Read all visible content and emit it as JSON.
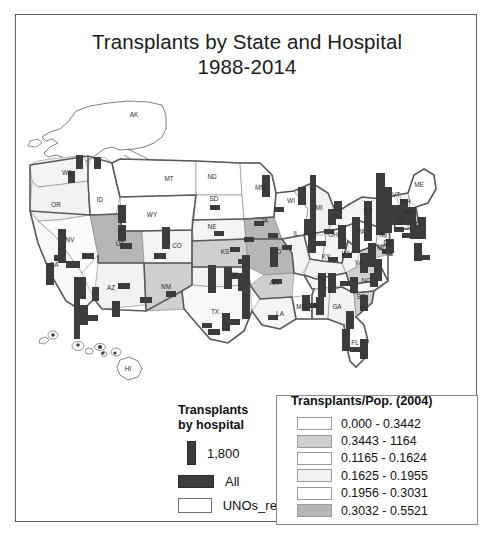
{
  "title": {
    "line1": "Transplants by State and Hospital",
    "line2": "1988-2014"
  },
  "map": {
    "state_labels": [
      {
        "code": "AK",
        "x": 118,
        "y": 38
      },
      {
        "code": "HI",
        "x": 112,
        "y": 293
      },
      {
        "code": "WA",
        "x": 51,
        "y": 98
      },
      {
        "code": "OR",
        "x": 40,
        "y": 130
      },
      {
        "code": "ID",
        "x": 84,
        "y": 125
      },
      {
        "code": "MT",
        "x": 153,
        "y": 104
      },
      {
        "code": "WY",
        "x": 136,
        "y": 140
      },
      {
        "code": "NV",
        "x": 54,
        "y": 165
      },
      {
        "code": "UT",
        "x": 104,
        "y": 169
      },
      {
        "code": "CA",
        "x": 38,
        "y": 190
      },
      {
        "code": "AZ",
        "x": 95,
        "y": 213
      },
      {
        "code": "NM",
        "x": 150,
        "y": 212
      },
      {
        "code": "CO",
        "x": 161,
        "y": 171
      },
      {
        "code": "ND",
        "x": 196,
        "y": 102
      },
      {
        "code": "SD",
        "x": 198,
        "y": 124
      },
      {
        "code": "NE",
        "x": 196,
        "y": 152
      },
      {
        "code": "KS",
        "x": 209,
        "y": 177
      },
      {
        "code": "OK",
        "x": 217,
        "y": 200
      },
      {
        "code": "TX",
        "x": 199,
        "y": 237
      },
      {
        "code": "MN",
        "x": 244,
        "y": 113
      },
      {
        "code": "IA",
        "x": 249,
        "y": 146
      },
      {
        "code": "MO",
        "x": 260,
        "y": 177
      },
      {
        "code": "AR",
        "x": 258,
        "y": 208
      },
      {
        "code": "LA",
        "x": 264,
        "y": 239
      },
      {
        "code": "WI",
        "x": 275,
        "y": 126
      },
      {
        "code": "IL",
        "x": 280,
        "y": 159
      },
      {
        "code": "MS",
        "x": 285,
        "y": 232
      },
      {
        "code": "MI",
        "x": 303,
        "y": 133
      },
      {
        "code": "IN",
        "x": 297,
        "y": 160
      },
      {
        "code": "KY",
        "x": 310,
        "y": 182
      },
      {
        "code": "TN",
        "x": 305,
        "y": 204
      },
      {
        "code": "AL",
        "x": 301,
        "y": 231
      },
      {
        "code": "GA",
        "x": 321,
        "y": 232
      },
      {
        "code": "OH",
        "x": 317,
        "y": 160
      },
      {
        "code": "WV",
        "x": 331,
        "y": 179
      },
      {
        "code": "VA",
        "x": 343,
        "y": 188
      },
      {
        "code": "NC",
        "x": 350,
        "y": 206
      },
      {
        "code": "SC",
        "x": 345,
        "y": 222
      },
      {
        "code": "FL",
        "x": 339,
        "y": 268
      },
      {
        "code": "PA",
        "x": 345,
        "y": 157
      },
      {
        "code": "NY",
        "x": 352,
        "y": 136
      },
      {
        "code": "VT",
        "x": 380,
        "y": 120
      },
      {
        "code": "NH",
        "x": 390,
        "y": 127
      },
      {
        "code": "MA",
        "x": 392,
        "y": 138
      },
      {
        "code": "CT",
        "x": 385,
        "y": 146
      },
      {
        "code": "RI",
        "x": 396,
        "y": 147
      },
      {
        "code": "NJ",
        "x": 367,
        "y": 160
      },
      {
        "code": "DE",
        "x": 372,
        "y": 168
      },
      {
        "code": "MD",
        "x": 366,
        "y": 173
      },
      {
        "code": "ME",
        "x": 403,
        "y": 110
      }
    ]
  },
  "legend_hospital": {
    "heading_line1": "Transplants",
    "heading_line2": "by hospital",
    "bar_value_label": "1,800",
    "all_label": "All",
    "regions_label": "UNOs_regions",
    "bar_color": "#3c3c3c",
    "region_outline_color": "#6e6e6e"
  },
  "legend_choropleth": {
    "heading": "Transplants/Pop. (2004)",
    "classes": [
      {
        "range": "0.000 - 0.3442",
        "color": "#ffffff"
      },
      {
        "range": "0.3443 - 1164",
        "color": "#cfcfcf"
      },
      {
        "range": "0.1165 - 0.1624",
        "color": "#ffffff"
      },
      {
        "range": "0.1625 - 0.1955",
        "color": "#f2f2f2"
      },
      {
        "range": "0.1956 - 0.3031",
        "color": "#ffffff"
      },
      {
        "range": "0.3032 - 0.5521",
        "color": "#b6b6b6"
      }
    ]
  }
}
